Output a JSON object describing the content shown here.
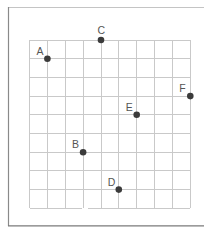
{
  "diagram": {
    "type": "coordinate-grid",
    "colors": {
      "grid": "#c9c9c9",
      "frame": "#8a8a8a",
      "dot": "#3b3b3b",
      "label": "#555555"
    },
    "grid": {
      "columns": 9,
      "rows": 9,
      "left": 29.5,
      "top": 40,
      "right": 190.3,
      "bottom": 208.3,
      "bottom_gap": {
        "from_col": 3,
        "gap_px": [
          82,
          88
        ]
      }
    },
    "points": [
      {
        "label": "A",
        "col": 1,
        "row": 1
      },
      {
        "label": "B",
        "col": 3,
        "row": 6
      },
      {
        "label": "C",
        "col": 4,
        "row": 0
      },
      {
        "label": "D",
        "col": 5,
        "row": 8
      },
      {
        "label": "E",
        "col": 6,
        "row": 4
      },
      {
        "label": "F",
        "col": 9,
        "row": 3
      }
    ]
  }
}
